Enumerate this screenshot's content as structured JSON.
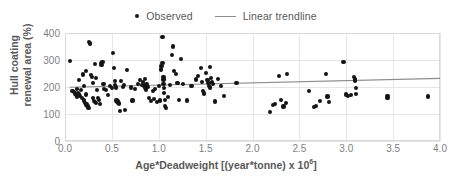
{
  "legend": {
    "position": "top-center",
    "entries": [
      {
        "label": "Observed",
        "marker": "dot",
        "color": "#141414"
      },
      {
        "label": "Linear trendline",
        "marker": "line",
        "color": "#8c8c8c"
      }
    ]
  },
  "axes": {
    "y_title_line1": "Hull coating",
    "y_title_line2": "renewal area (%)",
    "x_title_main": "Age*Deadweight [(year*tonne) x 10",
    "x_title_sup": "6",
    "x_title_tail": "]",
    "y_ticks": [
      "0",
      "100",
      "200",
      "300",
      "400"
    ],
    "x_ticks": [
      "0.0",
      "0.5",
      "1.0",
      "1.5",
      "2.0",
      "2.5",
      "3.0",
      "3.5",
      "4.0"
    ]
  },
  "chart_data": {
    "type": "scatter",
    "title": "",
    "xlabel": "Age*Deadweight [(year*tonne) x 10^6]",
    "ylabel": "Hull coating renewal area (%)",
    "xlim": [
      0.0,
      4.0
    ],
    "ylim": [
      0,
      400
    ],
    "xtick_step": 0.5,
    "ytick_step": 100,
    "grid": true,
    "series": [
      {
        "name": "Observed",
        "type": "scatter",
        "marker_color": "#141414",
        "points": [
          [
            0.05,
            297
          ],
          [
            0.08,
            186
          ],
          [
            0.1,
            182
          ],
          [
            0.11,
            176
          ],
          [
            0.12,
            170
          ],
          [
            0.13,
            192
          ],
          [
            0.13,
            165
          ],
          [
            0.14,
            178
          ],
          [
            0.15,
            225
          ],
          [
            0.15,
            172
          ],
          [
            0.16,
            168
          ],
          [
            0.17,
            188
          ],
          [
            0.18,
            160
          ],
          [
            0.19,
            246
          ],
          [
            0.2,
            205
          ],
          [
            0.2,
            150
          ],
          [
            0.21,
            141
          ],
          [
            0.22,
            258
          ],
          [
            0.22,
            172
          ],
          [
            0.23,
            135
          ],
          [
            0.24,
            131
          ],
          [
            0.25,
            123
          ],
          [
            0.26,
            368
          ],
          [
            0.27,
            358
          ],
          [
            0.27,
            363
          ],
          [
            0.28,
            245
          ],
          [
            0.29,
            237
          ],
          [
            0.3,
            216
          ],
          [
            0.3,
            158
          ],
          [
            0.31,
            148
          ],
          [
            0.32,
            284
          ],
          [
            0.32,
            144
          ],
          [
            0.33,
            140
          ],
          [
            0.33,
            232
          ],
          [
            0.34,
            190
          ],
          [
            0.35,
            160
          ],
          [
            0.36,
            152
          ],
          [
            0.37,
            136
          ],
          [
            0.38,
            290
          ],
          [
            0.39,
            280
          ],
          [
            0.4,
            292
          ],
          [
            0.41,
            210
          ],
          [
            0.42,
            192
          ],
          [
            0.44,
            188
          ],
          [
            0.46,
            170
          ],
          [
            0.48,
            205
          ],
          [
            0.5,
            197
          ],
          [
            0.51,
            327
          ],
          [
            0.52,
            270
          ],
          [
            0.53,
            222
          ],
          [
            0.53,
            206
          ],
          [
            0.54,
            198
          ],
          [
            0.55,
            150
          ],
          [
            0.56,
            146
          ],
          [
            0.57,
            142
          ],
          [
            0.58,
            138
          ],
          [
            0.59,
            112
          ],
          [
            0.6,
            223
          ],
          [
            0.62,
            199
          ],
          [
            0.63,
            208
          ],
          [
            0.64,
            114
          ],
          [
            0.66,
            262
          ],
          [
            0.7,
            198
          ],
          [
            0.72,
            150
          ],
          [
            0.75,
            192
          ],
          [
            0.78,
            212
          ],
          [
            0.8,
            225
          ],
          [
            0.82,
            208
          ],
          [
            0.83,
            218
          ],
          [
            0.84,
            203
          ],
          [
            0.85,
            231
          ],
          [
            0.85,
            196
          ],
          [
            0.86,
            188
          ],
          [
            0.87,
            210
          ],
          [
            0.88,
            200
          ],
          [
            0.9,
            160
          ],
          [
            0.92,
            148
          ],
          [
            0.94,
            184
          ],
          [
            0.95,
            155
          ],
          [
            0.96,
            192
          ],
          [
            0.98,
            145
          ],
          [
            1.0,
            205
          ],
          [
            1.01,
            150
          ],
          [
            1.02,
            265
          ],
          [
            1.03,
            278
          ],
          [
            1.04,
            385
          ],
          [
            1.04,
            290
          ],
          [
            1.05,
            238
          ],
          [
            1.05,
            228
          ],
          [
            1.05,
            210
          ],
          [
            1.06,
            196
          ],
          [
            1.06,
            178
          ],
          [
            1.07,
            152
          ],
          [
            1.07,
            130
          ],
          [
            1.08,
            122
          ],
          [
            1.1,
            163
          ],
          [
            1.12,
            207
          ],
          [
            1.14,
            318
          ],
          [
            1.15,
            350
          ],
          [
            1.16,
            258
          ],
          [
            1.18,
            248
          ],
          [
            1.2,
            214
          ],
          [
            1.22,
            152
          ],
          [
            1.24,
            303
          ],
          [
            1.26,
            210
          ],
          [
            1.3,
            150
          ],
          [
            1.35,
            203
          ],
          [
            1.4,
            228
          ],
          [
            1.42,
            240
          ],
          [
            1.45,
            270
          ],
          [
            1.46,
            218
          ],
          [
            1.47,
            186
          ],
          [
            1.48,
            176
          ],
          [
            1.5,
            252
          ],
          [
            1.52,
            226
          ],
          [
            1.53,
            215
          ],
          [
            1.54,
            205
          ],
          [
            1.55,
            198
          ],
          [
            1.55,
            274
          ],
          [
            1.56,
            232
          ],
          [
            1.57,
            220
          ],
          [
            1.58,
            210
          ],
          [
            1.6,
            146
          ],
          [
            1.63,
            230
          ],
          [
            1.66,
            204
          ],
          [
            1.7,
            166
          ],
          [
            1.83,
            214
          ],
          [
            2.19,
            107
          ],
          [
            2.22,
            133
          ],
          [
            2.24,
            138
          ],
          [
            2.28,
            241
          ],
          [
            2.3,
            152
          ],
          [
            2.33,
            128
          ],
          [
            2.36,
            140
          ],
          [
            2.37,
            248
          ],
          [
            2.6,
            186
          ],
          [
            2.66,
            126
          ],
          [
            2.68,
            130
          ],
          [
            2.72,
            148
          ],
          [
            2.78,
            248
          ],
          [
            2.8,
            165
          ],
          [
            2.82,
            144
          ],
          [
            2.97,
            293
          ],
          [
            3.0,
            172
          ],
          [
            3.02,
            168
          ],
          [
            3.05,
            170
          ],
          [
            3.08,
            236
          ],
          [
            3.09,
            228
          ],
          [
            3.09,
            222
          ],
          [
            3.1,
            196
          ],
          [
            3.1,
            175
          ],
          [
            3.44,
            168
          ],
          [
            3.44,
            160
          ],
          [
            3.87,
            165
          ]
        ]
      },
      {
        "name": "Linear trendline",
        "type": "line",
        "color": "#8c8c8c",
        "x_start": 0.05,
        "y_start": 199,
        "x_end": 4.0,
        "y_end": 232
      }
    ]
  }
}
